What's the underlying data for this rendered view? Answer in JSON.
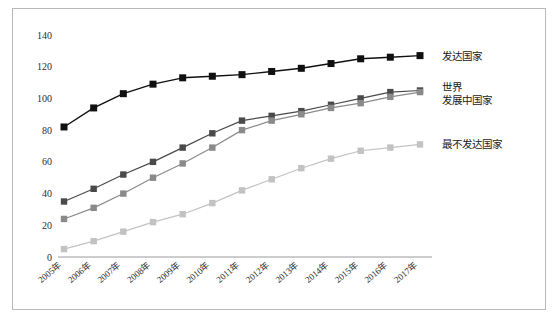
{
  "chart_data": {
    "type": "line",
    "title": "",
    "xlabel": "",
    "ylabel": "",
    "ylim": [
      0,
      140
    ],
    "ytick_step": 20,
    "yticks": [
      0,
      20,
      40,
      60,
      80,
      100,
      120,
      140
    ],
    "grid": false,
    "legend_position": "right",
    "categories": [
      "2005年",
      "2006年",
      "2007年",
      "2008年",
      "2009年",
      "2010年",
      "2011年",
      "2012年",
      "2013年",
      "2014年",
      "2015年",
      "2016年",
      "2017年"
    ],
    "series": [
      {
        "name": "发达国家",
        "color": "#101010",
        "marker": "square",
        "values": [
          82,
          94,
          103,
          109,
          113,
          114,
          115,
          117,
          119,
          122,
          125,
          126,
          127
        ]
      },
      {
        "name": "世界",
        "color": "#4a4a4a",
        "marker": "square",
        "values": [
          35,
          43,
          52,
          60,
          69,
          78,
          86,
          89,
          92,
          96,
          100,
          104,
          105
        ]
      },
      {
        "name": "发展中国家",
        "color": "#8a8a8a",
        "marker": "square",
        "values": [
          24,
          31,
          40,
          50,
          59,
          69,
          80,
          86,
          90,
          94,
          97,
          101,
          104
        ]
      },
      {
        "name": "最不发达国家",
        "color": "#c2c2c2",
        "marker": "square",
        "values": [
          5,
          10,
          16,
          22,
          27,
          34,
          42,
          49,
          56,
          62,
          67,
          69,
          71
        ]
      }
    ],
    "legend_entries": [
      {
        "label": "发达国家",
        "color": "#101010"
      },
      {
        "label": "世界",
        "color": "#4a4a4a"
      },
      {
        "label": "发展中国家",
        "color": "#8a8a8a"
      },
      {
        "label": "最不发达国家",
        "color": "#c2c2c2"
      }
    ]
  }
}
